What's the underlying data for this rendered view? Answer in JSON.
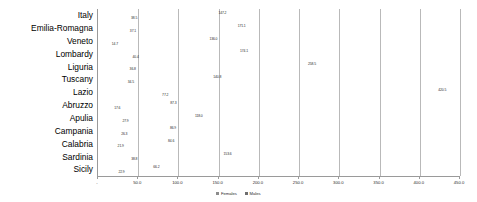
{
  "chart_data": {
    "type": "bar",
    "orientation": "horizontal",
    "title": "",
    "xlabel": "",
    "ylabel": "",
    "xlim": [
      0,
      450
    ],
    "grid": true,
    "legend_position": "bottom",
    "categories": [
      "Italy",
      "Emilia-Romagna",
      "Veneto",
      "Lombardy",
      "Liguria",
      "Tuscany",
      "Lazio",
      "Abruzzo",
      "Apulia",
      "Campania",
      "Calabria",
      "Sardinia",
      "Sicily"
    ],
    "series": [
      {
        "name": "Females",
        "color": "#8c8c8c",
        "values": [
          147.2,
          171.1,
          136.0,
          174.1,
          258.5,
          140.8,
          420.5,
          87.3,
          118.0,
          86.9,
          84.6,
          153.6,
          66.2
        ]
      },
      {
        "name": "Males",
        "color": "#6e6e6e",
        "values": [
          38.5,
          37.1,
          14.7,
          40.4,
          36.8,
          34.5,
          77.2,
          17.6,
          27.9,
          26.3,
          21.9,
          38.8,
          22.9
        ]
      }
    ],
    "xticks": [
      0,
      50,
      100,
      150,
      200,
      250,
      300,
      350,
      400,
      450
    ],
    "xtick_labels": [
      "-",
      "50.0",
      "100.0",
      "150.0",
      "200.0",
      "250.0",
      "300.0",
      "350.0",
      "400.0",
      "450.0"
    ]
  }
}
